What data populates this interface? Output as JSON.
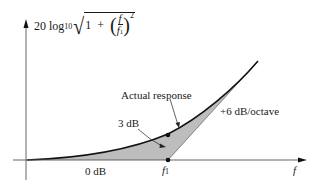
{
  "diagram": {
    "type": "bode-magnitude-plot",
    "y_axis_label": {
      "prefix": "20 log",
      "log_base": "10",
      "radicand_one": "1",
      "plus": "+",
      "fraction_numerator": "f",
      "fraction_denominator": "f",
      "fraction_denominator_sub": "1",
      "exponent": "2"
    },
    "x_axis_label": "f",
    "corner_frequency_label": "f",
    "corner_frequency_sub": "1",
    "annotations": {
      "actual_response": "Actual response",
      "three_db": "3 dB",
      "slope": "+6 dB/octave",
      "zero_db": "0 dB"
    },
    "colors": {
      "shaded_region": "#bdbdbd",
      "curve": "#111111",
      "axis": "#555555"
    }
  }
}
